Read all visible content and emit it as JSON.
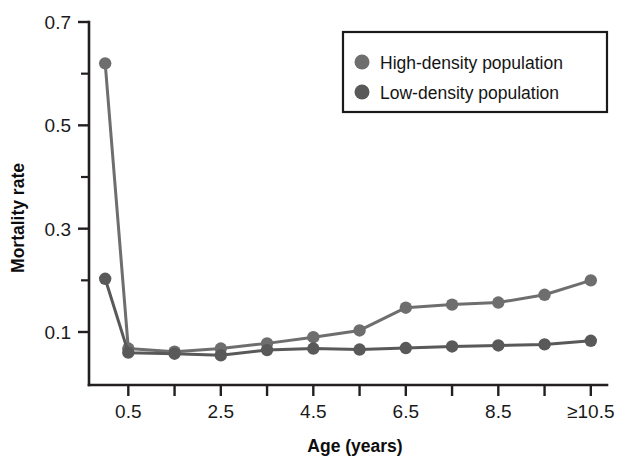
{
  "chart_data": {
    "type": "line",
    "title": "",
    "xlabel": "Age (years)",
    "ylabel": "Mortality rate",
    "grid": false,
    "legend_position": "top-right",
    "x": [
      0,
      0.5,
      1.5,
      2.5,
      3.5,
      4.5,
      5.5,
      6.5,
      7.5,
      8.5,
      9.5,
      10.5
    ],
    "x_tick_labels": [
      "0.5",
      "",
      "2.5",
      "",
      "4.5",
      "",
      "6.5",
      "",
      "8.5",
      "",
      "≥10.5"
    ],
    "x_tick_values": [
      0.5,
      1.5,
      2.5,
      3.5,
      4.5,
      5.5,
      6.5,
      7.5,
      8.5,
      9.5,
      10.5
    ],
    "xlim": [
      -0.35,
      10.85
    ],
    "ylim": [
      0.0,
      0.72
    ],
    "y_major_ticks": [
      0.1,
      0.3,
      0.5,
      0.7
    ],
    "y_major_tick_labels": [
      "0.1",
      "0.3",
      "0.5",
      "0.7"
    ],
    "y_minor_ticks": [
      0.2,
      0.4,
      0.6
    ],
    "series": [
      {
        "name": "High-density population",
        "color": "#6e6e6e",
        "marker": "circle",
        "values": [
          0.62,
          0.068,
          0.062,
          0.068,
          0.078,
          0.09,
          0.103,
          0.147,
          0.153,
          0.157,
          0.172,
          0.2
        ]
      },
      {
        "name": "Low-density population",
        "color": "#595959",
        "marker": "circle",
        "values": [
          0.203,
          0.06,
          0.058,
          0.055,
          0.065,
          0.068,
          0.066,
          0.069,
          0.072,
          0.074,
          0.076,
          0.083
        ]
      }
    ]
  },
  "legend": {
    "entries": [
      {
        "label": "High-density population",
        "color": "#6e6e6e"
      },
      {
        "label": "Low-density population",
        "color": "#595959"
      }
    ]
  },
  "axes": {
    "x_title": "Age (years)",
    "y_title": "Mortality rate"
  },
  "colors": {
    "axis": "#231f20",
    "text": "#141414",
    "background": "#ffffff",
    "series_high": "#6e6e6e",
    "series_low": "#595959"
  }
}
